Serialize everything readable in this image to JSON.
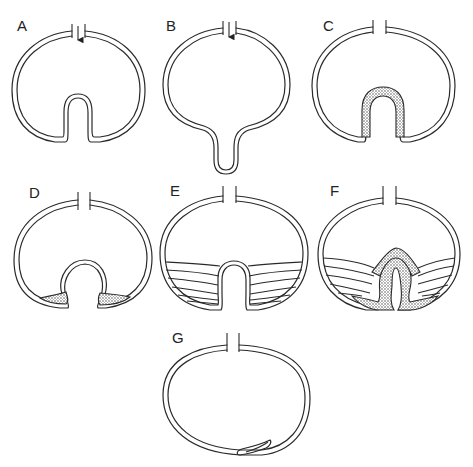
{
  "figure": {
    "type": "schematic diagram",
    "panels": [
      {
        "id": "A",
        "label": "A",
        "description": "Cyst-like sac with opening at top (arrow pointing inward) and an inward fold (invagination) at bottom"
      },
      {
        "id": "B",
        "label": "B",
        "description": "Sac with opening at top (arrow pointing inward) and an outward-protruding tubular extension at bottom"
      },
      {
        "id": "C",
        "label": "C",
        "description": "Sac with opening at top and a stippled inward fold at bottom"
      },
      {
        "id": "D",
        "label": "D",
        "description": "Sac with opening at top and a bulbous inward fold, stippled wedges on either side at base"
      },
      {
        "id": "E",
        "label": "E",
        "description": "Sac with opening at top, inward fold at bottom, with fanning lines (striations) filling the lower region"
      },
      {
        "id": "F",
        "label": "F",
        "description": "Sac with opening at top, stippled inward fold with fanning lines in the lower region"
      },
      {
        "id": "G",
        "label": "G",
        "description": "Oval sac with opening at top and a small flattened fold at lower right"
      }
    ]
  },
  "colors": {
    "line": "#2a2a2a",
    "background": "#ffffff"
  }
}
